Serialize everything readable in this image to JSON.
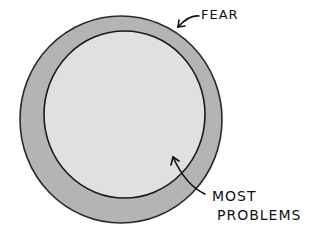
{
  "diagram": {
    "outer_region": {
      "label": "Fear",
      "fill": "#b4b4b4",
      "stroke": "#2a2a2a"
    },
    "inner_region": {
      "label_line1": "Most",
      "label_line2": "Problems",
      "fill": "#e0e0e0",
      "stroke": "#1a1a1a"
    },
    "labels": {
      "fear": "FeaR",
      "most": "MOST",
      "problems": "PROBLeMS"
    }
  }
}
